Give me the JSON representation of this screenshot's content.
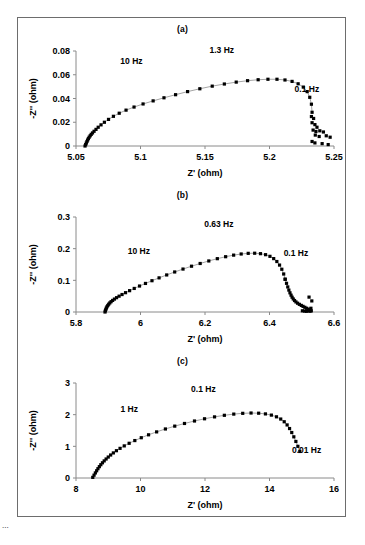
{
  "figure": {
    "background": "#ffffff",
    "border_color": "#6d6d6d",
    "marker_color": "#000000",
    "fit_line_color": "#9a9a9a",
    "axis_color": "#8a8a8a",
    "caption_partial": "...",
    "panels": [
      "(a)",
      "(b)",
      "(c)"
    ]
  },
  "chart_data": [
    {
      "type": "scatter",
      "title": "(a)",
      "xlabel": "Z' (ohm)",
      "ylabel": "-Z'' (ohm)",
      "xlim": [
        5.05,
        5.25
      ],
      "ylim": [
        0,
        0.08
      ],
      "xticks": [
        5.05,
        5.1,
        5.15,
        5.2,
        5.25
      ],
      "xtick_labels": [
        "5.05",
        "5.1",
        "5.15",
        "5.2",
        "5.25"
      ],
      "yticks": [
        0,
        0.02,
        0.04,
        0.06,
        0.08
      ],
      "ytick_labels": [
        "0",
        "0.02",
        "0.04",
        "0.06",
        "0.08"
      ],
      "grid": false,
      "legend": "none",
      "annotations": [
        {
          "text": "10 Hz",
          "x": 5.093,
          "y": 0.069
        },
        {
          "text": "1.3 Hz",
          "x": 5.163,
          "y": 0.0785
        },
        {
          "text": "0.1 Hz",
          "x": 5.229,
          "y": 0.0455
        }
      ],
      "series": [
        {
          "name": "impedance arc",
          "x": [
            5.057,
            5.0575,
            5.058,
            5.0585,
            5.059,
            5.0596,
            5.0602,
            5.061,
            5.0618,
            5.0628,
            5.064,
            5.0655,
            5.0672,
            5.0694,
            5.072,
            5.0752,
            5.079,
            5.0835,
            5.0888,
            5.095,
            5.102,
            5.1098,
            5.1182,
            5.1272,
            5.1365,
            5.146,
            5.1556,
            5.165,
            5.1742,
            5.183,
            5.1912,
            5.1988,
            5.2058,
            5.212,
            5.2175,
            5.2222,
            5.2262,
            5.2292,
            5.2312,
            5.2325,
            5.233
          ],
          "y": [
            0.0,
            0.0012,
            0.0025,
            0.0038,
            0.005,
            0.0062,
            0.0074,
            0.0086,
            0.0098,
            0.011,
            0.0124,
            0.014,
            0.0158,
            0.0178,
            0.02,
            0.0224,
            0.025,
            0.0276,
            0.0302,
            0.0328,
            0.0354,
            0.038,
            0.0406,
            0.0432,
            0.0458,
            0.0482,
            0.0504,
            0.0522,
            0.0538,
            0.055,
            0.0558,
            0.0562,
            0.0562,
            0.0556,
            0.0544,
            0.0524,
            0.0496,
            0.0458,
            0.041,
            0.0352,
            0.0284
          ]
        },
        {
          "name": "low-frequency scatter tail",
          "x": [
            5.2325,
            5.2342,
            5.233,
            5.2352,
            5.2368,
            5.2338,
            5.236,
            5.239,
            5.2418,
            5.2355,
            5.2385,
            5.244,
            5.247,
            5.233,
            5.2352,
            5.2408,
            5.2455
          ],
          "y": [
            0.0248,
            0.0232,
            0.0196,
            0.018,
            0.0158,
            0.0134,
            0.0122,
            0.0128,
            0.0118,
            0.0092,
            0.008,
            0.0086,
            0.0074,
            0.0038,
            0.0026,
            0.002,
            0.0012
          ]
        }
      ]
    },
    {
      "type": "scatter",
      "title": "(b)",
      "xlabel": "Z' (ohm)",
      "ylabel": "-Z'' (ohm)",
      "xlim": [
        5.8,
        6.6
      ],
      "ylim": [
        0,
        0.3
      ],
      "xticks": [
        5.8,
        6.0,
        6.2,
        6.4,
        6.6
      ],
      "xtick_labels": [
        "5.8",
        "6",
        "6.2",
        "6.4",
        "6.6"
      ],
      "yticks": [
        0,
        0.1,
        0.2,
        0.3
      ],
      "ytick_labels": [
        "0",
        "0.1",
        "0.2",
        "0.3"
      ],
      "grid": false,
      "legend": "none",
      "annotations": [
        {
          "text": "10 Hz",
          "x": 5.995,
          "y": 0.182
        },
        {
          "text": "0.63 Hz",
          "x": 6.243,
          "y": 0.268
        },
        {
          "text": "0.1 Hz",
          "x": 6.482,
          "y": 0.178
        }
      ],
      "series": [
        {
          "name": "impedance arc",
          "x": [
            5.89,
            5.8912,
            5.8926,
            5.8942,
            5.8962,
            5.8986,
            5.9014,
            5.9048,
            5.9088,
            5.9136,
            5.9192,
            5.9258,
            5.9336,
            5.9428,
            5.9536,
            5.9662,
            5.9806,
            5.997,
            6.0154,
            6.0356,
            6.0576,
            6.0812,
            6.106,
            6.1318,
            6.1582,
            6.185,
            6.2118,
            6.2382,
            6.264,
            6.2888,
            6.3122,
            6.334,
            6.354,
            6.372,
            6.3878,
            6.4014,
            6.413,
            6.4228,
            6.4312,
            6.4382,
            6.444,
            6.4486
          ],
          "y": [
            0.0,
            0.0042,
            0.0084,
            0.0126,
            0.0166,
            0.0206,
            0.0246,
            0.0286,
            0.0326,
            0.0366,
            0.0408,
            0.0452,
            0.05,
            0.0552,
            0.061,
            0.0674,
            0.0744,
            0.082,
            0.0902,
            0.0988,
            0.1078,
            0.117,
            0.1264,
            0.1356,
            0.1446,
            0.1532,
            0.1612,
            0.1684,
            0.1746,
            0.1796,
            0.1832,
            0.1852,
            0.1856,
            0.1842,
            0.181,
            0.1758,
            0.1686,
            0.1594,
            0.1482,
            0.135,
            0.12,
            0.1034
          ]
        },
        {
          "name": "high-Z rollover",
          "x": [
            6.4486,
            6.4528,
            6.4566,
            6.46,
            6.4634,
            6.4668,
            6.47,
            6.4736,
            6.4776,
            6.482,
            6.487,
            6.4926,
            6.4986,
            6.504,
            6.5096,
            6.515,
            6.52,
            6.5248,
            6.5296
          ],
          "y": [
            0.1034,
            0.0906,
            0.0792,
            0.0692,
            0.0606,
            0.0532,
            0.0468,
            0.0412,
            0.0362,
            0.0318,
            0.0278,
            0.0242,
            0.0208,
            0.0178,
            0.0148,
            0.0118,
            0.009,
            0.0062,
            0.0036
          ]
        },
        {
          "name": "low-frequency scatter tail",
          "x": [
            6.502,
            6.5086,
            6.514,
            6.5196,
            6.5256,
            6.5312,
            6.5226,
            6.5284
          ],
          "y": [
            0.0038,
            0.003,
            0.0022,
            0.0034,
            0.0026,
            0.035,
            0.047,
            0.0118
          ]
        }
      ]
    },
    {
      "type": "scatter",
      "title": "(c)",
      "xlabel": "Z' (ohm)",
      "ylabel": "-Z'' (ohm)",
      "xlim": [
        8,
        16
      ],
      "ylim": [
        0,
        3
      ],
      "xticks": [
        8,
        10,
        12,
        14,
        16
      ],
      "xtick_labels": [
        "8",
        "10",
        "12",
        "14",
        "16"
      ],
      "yticks": [
        0,
        1,
        2,
        3
      ],
      "ytick_labels": [
        "0",
        "1",
        "2",
        "3"
      ],
      "grid": false,
      "legend": "none",
      "annotations": [
        {
          "text": "1 Hz",
          "x": 9.65,
          "y": 2.1
        },
        {
          "text": "0.1 Hz",
          "x": 11.95,
          "y": 2.72
        },
        {
          "text": "0.01 Hz",
          "x": 15.15,
          "y": 0.8
        }
      ],
      "series": [
        {
          "name": "impedance arc",
          "x": [
            8.52,
            8.56,
            8.6,
            8.64,
            8.68,
            8.724,
            8.77,
            8.82,
            8.874,
            8.934,
            9.0,
            9.074,
            9.158,
            9.254,
            9.366,
            9.496,
            9.648,
            9.824,
            10.024,
            10.25,
            10.5,
            10.772,
            11.062,
            11.364,
            11.674,
            11.986,
            12.296,
            12.6,
            12.892,
            13.17,
            13.428,
            13.664,
            13.874,
            14.058,
            14.216,
            14.348,
            14.456,
            14.546,
            14.622,
            14.69,
            14.754,
            14.818,
            14.88,
            14.94
          ],
          "y": [
            0.02,
            0.09,
            0.16,
            0.228,
            0.294,
            0.358,
            0.42,
            0.48,
            0.54,
            0.6,
            0.662,
            0.726,
            0.792,
            0.862,
            0.936,
            1.014,
            1.096,
            1.182,
            1.272,
            1.364,
            1.456,
            1.548,
            1.638,
            1.722,
            1.8,
            1.87,
            1.93,
            1.98,
            2.018,
            2.042,
            2.052,
            2.046,
            2.024,
            1.986,
            1.932,
            1.862,
            1.776,
            1.676,
            1.562,
            1.436,
            1.3,
            1.154,
            1.0,
            0.838
          ]
        }
      ]
    }
  ]
}
